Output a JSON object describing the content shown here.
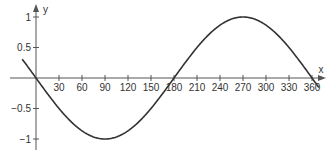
{
  "chart_data": {
    "type": "line",
    "title": "",
    "xlabel": "x",
    "ylabel": "y",
    "function": "y = -sin(x)",
    "x_ticks": [
      30,
      60,
      90,
      120,
      150,
      180,
      210,
      240,
      270,
      300,
      330,
      360
    ],
    "y_ticks": [
      1,
      0.5,
      -0.5,
      -1
    ],
    "y_tick_labels": [
      "1",
      "0.5",
      "−0.5",
      "−1"
    ],
    "xlim": [
      -18,
      369
    ],
    "ylim": [
      -1,
      1
    ],
    "grid": false,
    "series": [
      {
        "name": "y = -sin(x)",
        "x": [
          -18,
          0,
          30,
          60,
          90,
          120,
          150,
          180,
          210,
          240,
          270,
          300,
          330,
          360,
          369
        ],
        "values": [
          0.31,
          0,
          -0.5,
          -0.87,
          -1,
          -0.87,
          -0.5,
          0,
          0.5,
          0.87,
          1,
          0.87,
          0.5,
          0,
          -0.16
        ]
      }
    ],
    "colors": {
      "axis": "#555555",
      "curve": "#333333"
    }
  }
}
